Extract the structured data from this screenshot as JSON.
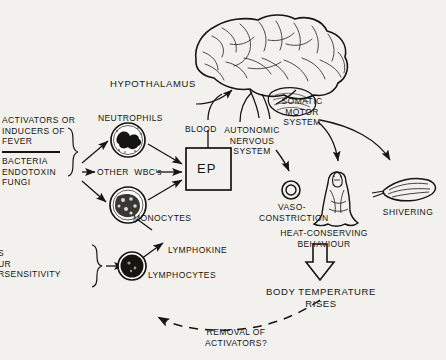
{
  "figure": {
    "background_color": "#f2f1ee",
    "ink_color": "#16150f"
  },
  "labels": {
    "hypothalamus": "HYPOTHALAMUS",
    "activators_header": "ACTIVATORS OR\nINDUCERS OF\nFEVER",
    "activators_group_a": "BACTERIA\nENDOTOXIN\nFUNGI",
    "activators_group_b": "S\nUR\nRSENSITIVITY",
    "neutrophils": "NEUTROPHILS",
    "other_wbcs": "OTHER  WBC's",
    "monocytes": "MONOCYTES",
    "lymphocytes": "LYMPHOCYTES",
    "lymphokine": "LYMPHOKINE",
    "blood": "BLOOD",
    "ep": "EP",
    "autonomic": "AUTONOMIC\nNERVOUS\nSYSTEM",
    "somatic": "SOMATIC\nMOTOR\nSYSTEM",
    "vasoconstriction": "VASO-\nCONSTRICTION",
    "heat_conserving": "HEAT-CONSERVING\nBEHAVIOUR",
    "shivering": "SHIVERING",
    "body_temperature": "BODY TEMPERATURE\nRISES",
    "removal": "REMOVAL OF\nACTIVATORS?"
  },
  "icons": {
    "brain": "brain-icon",
    "neutrophil": "neutrophil-cell-icon",
    "monocyte": "monocyte-cell-icon",
    "lymphocyte": "lymphocyte-cell-icon",
    "vessel": "constricted-vessel-icon",
    "person": "blanketed-person-icon",
    "muscle": "muscle-icon",
    "block_arrow": "block-arrow-down-icon",
    "ep_box": "ep-box"
  }
}
